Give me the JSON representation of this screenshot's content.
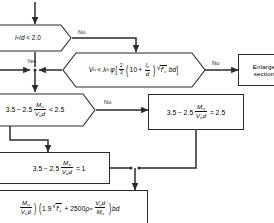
{
  "figure": {
    "type": "flowchart",
    "background_color": "#ffffff",
    "line_color": "#2b2b2b",
    "text_color": "#000000"
  },
  "nodes": {
    "decision_slenderness": {
      "id": "decision-slenderness",
      "shape": "hexagon",
      "text_plain": "ln/d < 2.0",
      "parts": {
        "var": "l",
        "var_sub": "n",
        "div": "/",
        "denom": "d",
        "op": "<",
        "value": "2.0"
      }
    },
    "decision_capacity": {
      "id": "decision-capacity",
      "shape": "hexagon",
      "text_plain": "Vu < λ0 φ[ 2/3 (10 + ln/d) √f'c bd ]",
      "parts": {
        "lhs": "V",
        "lhs_sub": "u",
        "op": "<",
        "lambda": "λ",
        "lambda_sub": "0",
        "phi": "φ",
        "bracket_open": "[",
        "frac_num": "2",
        "frac_den": "3",
        "inner_const": "10",
        "inner_plus": "+",
        "inner_num": "l",
        "inner_num_sub": "n",
        "inner_den": "d",
        "radicand": "f",
        "radicand_prime": "′",
        "radicand_sub": "c",
        "tail": "bd",
        "bracket_close": "]"
      }
    },
    "decision_ratio": {
      "id": "decision-ratio",
      "shape": "hexagon",
      "text_plain": "3.5 - 2.5 Mu/(Vu d) < 2.5",
      "parts": {
        "a": "3.5",
        "minus": "−",
        "b": "2.5",
        "num": "M",
        "num_sub": "u",
        "den_v": "V",
        "den_sub": "u",
        "den_d": "d",
        "op": "<",
        "value": "2.5"
      }
    },
    "process_enlarge": {
      "id": "process-enlarge",
      "shape": "rectangle",
      "line1": "Enlarge",
      "line2": "section"
    },
    "process_ratio_equals_25": {
      "id": "process-ratio-equals-2point5",
      "shape": "rectangle",
      "text_plain": "3.5 - 2.5 Mu/(Vu d) = 2.5",
      "parts": {
        "a": "3.5",
        "minus": "−",
        "b": "2.5",
        "num": "M",
        "num_sub": "u",
        "den_v": "V",
        "den_sub": "u",
        "den_d": "d",
        "op": "=",
        "value": "2.5"
      }
    },
    "process_ratio_equals_1": {
      "id": "process-ratio-equals-1",
      "shape": "rectangle",
      "text_plain": "3.5 - 2.5 Mu/(Vu d) = 1",
      "parts": {
        "a": "3.5",
        "minus": "−",
        "b": "2.5",
        "num": "M",
        "num_sub": "u",
        "den_v": "V",
        "den_sub": "u",
        "den_d": "d",
        "op": "=",
        "value": "1"
      }
    },
    "process_vc_formula": {
      "id": "process-vc-formula",
      "shape": "rectangle",
      "text_plain": "( Mu/(Vu d) ) ( 1.9 √f'c + 2500 ρw Vu d/Mu ) bd",
      "parts": {
        "frac1_num": "M",
        "frac1_num_sub": "u",
        "frac1_den_v": "V",
        "frac1_den_sub": "u",
        "frac1_den_d": "d",
        "coef": "1.9",
        "radicand": "f",
        "radicand_prime": "′",
        "radicand_sub": "c",
        "plus": "+",
        "const": "2500",
        "rho": "ρ",
        "rho_sub": "w",
        "frac2_num_v": "V",
        "frac2_num_sub": "u",
        "frac2_num_d": "d",
        "frac2_den_m": "M",
        "frac2_den_sub": "u",
        "tail": "bd"
      }
    }
  },
  "edge_labels": {
    "slenderness_no": "No",
    "slenderness_yes": "Yes",
    "capacity_no": "No",
    "ratio_no": "No"
  }
}
